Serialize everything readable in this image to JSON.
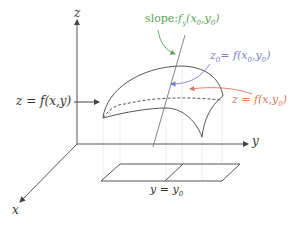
{
  "diagram": {
    "type": "3d-surface-partial-derivative",
    "axes": {
      "z_label": "z",
      "y_label": "y",
      "x_label": "x"
    },
    "labels": {
      "surface_left": "z = f(x,y)",
      "slope": "slope: f_y(x_0, y_0)",
      "slope_prefix": "slope:",
      "slope_func": "f",
      "slope_sub": "y",
      "slope_args": "(x",
      "slope_args_sub0": "0",
      "slope_args_mid": ",y",
      "slope_args_sub1": "0",
      "slope_args_end": ")",
      "point_value": "z_0 = f(x_0, y_0)",
      "point_z": "z",
      "point_z_sub": "0",
      "point_eq": "= f(x",
      "point_sub0": "0",
      "point_mid": ",y",
      "point_sub1": "0",
      "point_end": ")",
      "trace_curve": "z = f(x, y_0)",
      "trace_prefix": "z = f(x,y",
      "trace_sub": "0",
      "trace_end": ")",
      "plane_label": "y = y_0",
      "plane_prefix": "y = y",
      "plane_sub": "0"
    },
    "colors": {
      "axis": "#555555",
      "surface": "#555555",
      "slope": "#5aa35a",
      "point": "#7a7fc0",
      "trace": "#e0745e",
      "guides": "#bbbbbb"
    }
  }
}
